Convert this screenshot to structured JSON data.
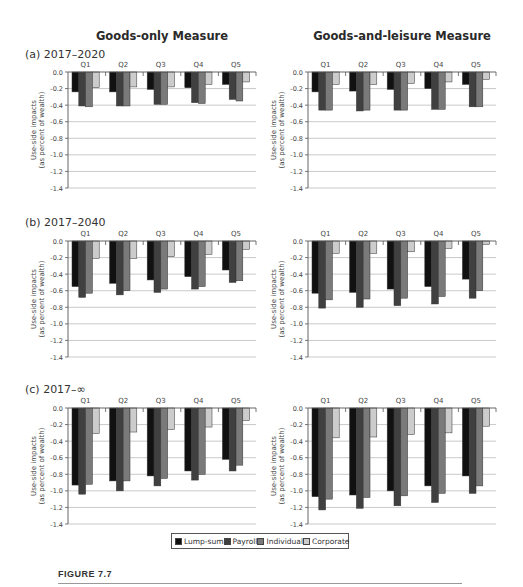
{
  "columns": {
    "left_title": "Goods-only Measure",
    "right_title": "Goods-and-leisure Measure"
  },
  "panels": [
    {
      "label": "(a) 2017–2020"
    },
    {
      "label": "(b) 2017–2040"
    },
    {
      "label": "(c) 2017–∞"
    }
  ],
  "legend": {
    "items": [
      {
        "label": "Lump-sum",
        "color": "#111111"
      },
      {
        "label": "Payroll",
        "color": "#404040"
      },
      {
        "label": "Individual",
        "color": "#7a7a7a"
      },
      {
        "label": "Corporate",
        "color": "#cccccc"
      }
    ]
  },
  "figure": {
    "label": "FIGURE 7.7"
  },
  "chart_data": [
    {
      "type": "bar",
      "title": "Goods-only Measure — (a) 2017–2020",
      "categories": [
        "Q1",
        "Q2",
        "Q3",
        "Q4",
        "Q5"
      ],
      "ylabel": "Use-side impacts (as percent of wealth)",
      "ylim": [
        -1.4,
        0.0
      ],
      "yticks": [
        "0.0",
        "-0.2",
        "-0.4",
        "-0.6",
        "-0.8",
        "-1.0",
        "-1.2",
        "-1.4"
      ],
      "grid": true,
      "legend_position": "bottom",
      "series": [
        {
          "name": "Lump-sum",
          "values": [
            -0.24,
            -0.24,
            -0.21,
            -0.19,
            -0.15
          ]
        },
        {
          "name": "Payroll",
          "values": [
            -0.41,
            -0.41,
            -0.39,
            -0.37,
            -0.33
          ]
        },
        {
          "name": "Individual",
          "values": [
            -0.42,
            -0.41,
            -0.39,
            -0.38,
            -0.35
          ]
        },
        {
          "name": "Corporate",
          "values": [
            -0.19,
            -0.18,
            -0.18,
            -0.15,
            -0.12
          ]
        }
      ]
    },
    {
      "type": "bar",
      "title": "Goods-and-leisure Measure — (a) 2017–2020",
      "categories": [
        "Q1",
        "Q2",
        "Q3",
        "Q4",
        "Q5"
      ],
      "ylabel": "Use-side impacts (as percent of wealth)",
      "ylim": [
        -1.4,
        0.0
      ],
      "yticks": [
        "0.0",
        "-0.2",
        "-0.4",
        "-0.6",
        "-0.8",
        "-1.0",
        "-1.2",
        "-1.4"
      ],
      "grid": true,
      "legend_position": "bottom",
      "series": [
        {
          "name": "Lump-sum",
          "values": [
            -0.24,
            -0.23,
            -0.21,
            -0.2,
            -0.15
          ]
        },
        {
          "name": "Payroll",
          "values": [
            -0.46,
            -0.47,
            -0.46,
            -0.45,
            -0.42
          ]
        },
        {
          "name": "Individual",
          "values": [
            -0.46,
            -0.46,
            -0.46,
            -0.45,
            -0.42
          ]
        },
        {
          "name": "Corporate",
          "values": [
            -0.15,
            -0.15,
            -0.14,
            -0.12,
            -0.09
          ]
        }
      ]
    },
    {
      "type": "bar",
      "title": "Goods-only Measure — (b) 2017–2040",
      "categories": [
        "Q1",
        "Q2",
        "Q3",
        "Q4",
        "Q5"
      ],
      "ylabel": "Use-side impacts (as percent of wealth)",
      "ylim": [
        -1.4,
        0.0
      ],
      "yticks": [
        "0.0",
        "-0.2",
        "-0.4",
        "-0.6",
        "-0.8",
        "-1.0",
        "-1.2",
        "-1.4"
      ],
      "grid": true,
      "legend_position": "bottom",
      "series": [
        {
          "name": "Lump-sum",
          "values": [
            -0.55,
            -0.51,
            -0.47,
            -0.43,
            -0.35
          ]
        },
        {
          "name": "Payroll",
          "values": [
            -0.68,
            -0.65,
            -0.62,
            -0.58,
            -0.5
          ]
        },
        {
          "name": "Individual",
          "values": [
            -0.63,
            -0.6,
            -0.58,
            -0.55,
            -0.48
          ]
        },
        {
          "name": "Corporate",
          "values": [
            -0.21,
            -0.21,
            -0.19,
            -0.16,
            -0.1
          ]
        }
      ]
    },
    {
      "type": "bar",
      "title": "Goods-and-leisure Measure — (b) 2017–2040",
      "categories": [
        "Q1",
        "Q2",
        "Q3",
        "Q4",
        "Q5"
      ],
      "ylabel": "Use-side impacts (as percent of wealth)",
      "ylim": [
        -1.4,
        0.0
      ],
      "yticks": [
        "0.0",
        "-0.2",
        "-0.4",
        "-0.6",
        "-0.8",
        "-1.0",
        "-1.2",
        "-1.4"
      ],
      "grid": true,
      "legend_position": "bottom",
      "series": [
        {
          "name": "Lump-sum",
          "values": [
            -0.63,
            -0.62,
            -0.58,
            -0.55,
            -0.46
          ]
        },
        {
          "name": "Payroll",
          "values": [
            -0.81,
            -0.8,
            -0.78,
            -0.76,
            -0.69
          ]
        },
        {
          "name": "Individual",
          "values": [
            -0.71,
            -0.7,
            -0.69,
            -0.67,
            -0.6
          ]
        },
        {
          "name": "Corporate",
          "values": [
            -0.15,
            -0.15,
            -0.13,
            -0.09,
            -0.04
          ]
        }
      ]
    },
    {
      "type": "bar",
      "title": "Goods-only Measure — (c) 2017–∞",
      "categories": [
        "Q1",
        "Q2",
        "Q3",
        "Q4",
        "Q5"
      ],
      "ylabel": "Use-side impacts (as percent of wealth)",
      "ylim": [
        -1.4,
        0.0
      ],
      "yticks": [
        "0.0",
        "-0.2",
        "-0.4",
        "-0.6",
        "-0.8",
        "-1.0",
        "-1.2",
        "-1.4"
      ],
      "grid": true,
      "legend_position": "bottom",
      "series": [
        {
          "name": "Lump-sum",
          "values": [
            -0.93,
            -0.88,
            -0.82,
            -0.76,
            -0.62
          ]
        },
        {
          "name": "Payroll",
          "values": [
            -1.04,
            -1.0,
            -0.94,
            -0.87,
            -0.76
          ]
        },
        {
          "name": "Individual",
          "values": [
            -0.92,
            -0.88,
            -0.85,
            -0.8,
            -0.69
          ]
        },
        {
          "name": "Corporate",
          "values": [
            -0.31,
            -0.29,
            -0.26,
            -0.23,
            -0.15
          ]
        }
      ]
    },
    {
      "type": "bar",
      "title": "Goods-and-leisure Measure — (c) 2017–∞",
      "categories": [
        "Q1",
        "Q2",
        "Q3",
        "Q4",
        "Q5"
      ],
      "ylabel": "Use-side impacts (as percent of wealth)",
      "ylim": [
        -1.4,
        0.0
      ],
      "yticks": [
        "0.0",
        "-0.2",
        "-0.4",
        "-0.6",
        "-0.8",
        "-1.0",
        "-1.2",
        "-1.4"
      ],
      "grid": true,
      "legend_position": "bottom",
      "series": [
        {
          "name": "Lump-sum",
          "values": [
            -1.07,
            -1.05,
            -1.0,
            -0.94,
            -0.82
          ]
        },
        {
          "name": "Payroll",
          "values": [
            -1.23,
            -1.21,
            -1.18,
            -1.14,
            -1.03
          ]
        },
        {
          "name": "Individual",
          "values": [
            -1.1,
            -1.08,
            -1.06,
            -1.03,
            -0.94
          ]
        },
        {
          "name": "Corporate",
          "values": [
            -0.36,
            -0.35,
            -0.32,
            -0.3,
            -0.22
          ]
        }
      ]
    }
  ]
}
